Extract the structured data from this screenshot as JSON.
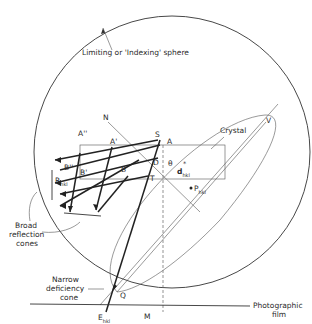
{
  "diagram": {
    "labels": {
      "sphere": "Limiting or 'Indexing' sphere",
      "crystal": "Crystal",
      "N": "N",
      "S": "S",
      "A": "A",
      "A1": "A'",
      "A2": "A''",
      "B": "B",
      "B1": "B'",
      "B2": "B''",
      "D": "D",
      "T": "T",
      "theta": "θ",
      "d_main": "d",
      "d_sup": "*",
      "d_sub": "hkl",
      "P_main": "P",
      "P_sub": "hkl",
      "R_main": "R",
      "R_sub": "hkl",
      "V": "V",
      "Q": "Q",
      "E_main": "E",
      "E_sub": "hkl",
      "M": "M",
      "broad_line1": "Broad",
      "broad_line2": "reflection",
      "broad_line3": "cones",
      "narrow_line1": "Narrow",
      "narrow_line2": "deficiency",
      "narrow_line3": "cone",
      "film_line1": "Photographic",
      "film_line2": "film"
    }
  }
}
